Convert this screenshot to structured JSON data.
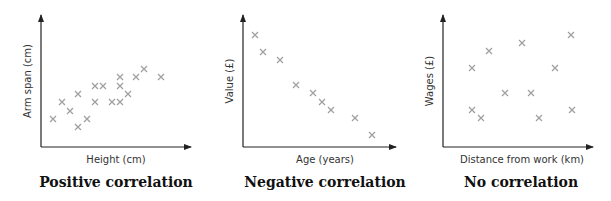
{
  "chart_data": [
    {
      "type": "scatter",
      "title": "Positive correlation",
      "xlabel": "Height (cm)",
      "ylabel": "Arm span (cm)",
      "grid": false,
      "ticks": "none",
      "origin_px": [
        41,
        147
      ],
      "axis_end_px": {
        "x": 191,
        "y": 15
      },
      "points_px": [
        [
          53,
          119
        ],
        [
          62,
          102
        ],
        [
          70,
          111
        ],
        [
          78,
          94
        ],
        [
          78,
          127
        ],
        [
          87,
          119
        ],
        [
          95,
          86
        ],
        [
          103,
          86
        ],
        [
          95,
          102
        ],
        [
          112,
          102
        ],
        [
          120,
          102
        ],
        [
          120,
          86
        ],
        [
          120,
          77
        ],
        [
          128,
          94
        ],
        [
          136,
          77
        ],
        [
          144,
          69
        ],
        [
          161,
          77
        ]
      ]
    },
    {
      "type": "scatter",
      "title": "Negative correlation",
      "xlabel": "Age (years)",
      "ylabel": "Value (£)",
      "grid": false,
      "ticks": "none",
      "origin_px": [
        243,
        147
      ],
      "axis_end_px": {
        "x": 396,
        "y": 15
      },
      "points_px": [
        [
          255,
          35
        ],
        [
          263,
          52
        ],
        [
          280,
          60
        ],
        [
          296,
          85
        ],
        [
          313,
          93
        ],
        [
          322,
          102
        ],
        [
          331,
          110
        ],
        [
          355,
          118
        ],
        [
          372,
          135
        ]
      ]
    },
    {
      "type": "scatter",
      "title": "No correlation",
      "xlabel": "Distance from work (km)",
      "ylabel": "Wages (£)",
      "grid": false,
      "ticks": "none",
      "origin_px": [
        443,
        147
      ],
      "axis_end_px": {
        "x": 593,
        "y": 15
      },
      "points_px": [
        [
          472,
          68
        ],
        [
          489,
          51
        ],
        [
          522,
          43
        ],
        [
          571,
          35
        ],
        [
          555,
          68
        ],
        [
          505,
          93
        ],
        [
          531,
          93
        ],
        [
          472,
          110
        ],
        [
          481,
          118
        ],
        [
          539,
          118
        ],
        [
          572,
          110
        ]
      ]
    }
  ],
  "colors": {
    "axis": "#222222",
    "marker": "#a0a0a0"
  },
  "charts": [
    {
      "title": "Positive correlation",
      "xlabel": "Height (cm)",
      "ylabel": "Arm span (cm)"
    },
    {
      "title": "Negative correlation",
      "xlabel": "Age (years)",
      "ylabel": "Value (£)"
    },
    {
      "title": "No correlation",
      "xlabel": "Distance from work (km)",
      "ylabel": "Wages (£)"
    }
  ]
}
